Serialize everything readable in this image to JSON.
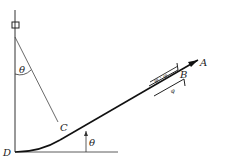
{
  "diagram": {
    "labels": {
      "A": "A",
      "B": "B",
      "C": "C",
      "D": "D",
      "theta_top": "θ",
      "theta_bottom": "θ",
      "fill_upper": "φ · φ",
      "fill_lower": "φ"
    },
    "colors": {
      "line": "#222222",
      "text": "#222222",
      "background": "#ffffff"
    }
  }
}
